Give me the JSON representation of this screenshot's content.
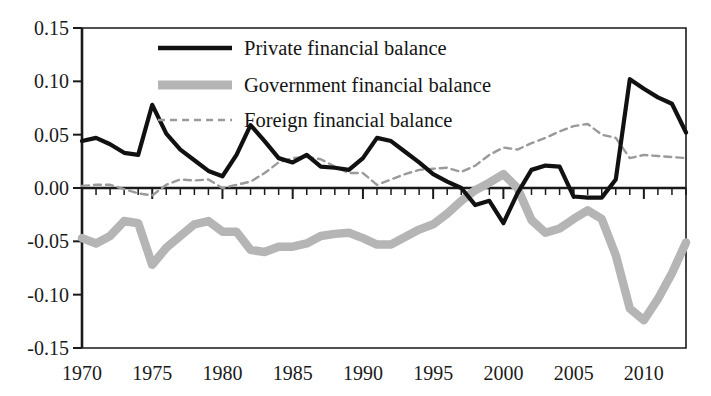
{
  "chart_data": {
    "type": "line",
    "title": "",
    "subtitle": "",
    "xlabel": "",
    "ylabel": "",
    "xlim": [
      1970,
      2013
    ],
    "ylim": [
      -0.15,
      0.15
    ],
    "grid": false,
    "legend_position": "top-center",
    "x_tick_labels": [
      "1970",
      "1975",
      "1980",
      "1985",
      "1990",
      "1995",
      "2000",
      "2005",
      "2010"
    ],
    "x_tick_values": [
      1970,
      1975,
      1980,
      1985,
      1990,
      1995,
      2000,
      2005,
      2010
    ],
    "x_minor_tick_step": 1,
    "y_tick_labels": [
      "0.15",
      "0.10",
      "0.05",
      "0.00",
      "-0.05",
      "-0.10",
      "-0.15"
    ],
    "y_tick_values": [
      0.15,
      0.1,
      0.05,
      0,
      -0.05,
      -0.1,
      -0.15
    ],
    "x": [
      1970,
      1971,
      1972,
      1973,
      1974,
      1975,
      1976,
      1977,
      1978,
      1979,
      1980,
      1981,
      1982,
      1983,
      1984,
      1985,
      1986,
      1987,
      1988,
      1989,
      1990,
      1991,
      1992,
      1993,
      1994,
      1995,
      1996,
      1997,
      1998,
      1999,
      2000,
      2001,
      2002,
      2003,
      2004,
      2005,
      2006,
      2007,
      2008,
      2009,
      2010,
      2011,
      2012,
      2013
    ],
    "series": [
      {
        "name": "Private financial balance",
        "color": "#111111",
        "style": "solid",
        "width": 4.2,
        "values": [
          0.044,
          0.047,
          0.041,
          0.033,
          0.031,
          0.078,
          0.051,
          0.036,
          0.026,
          0.016,
          0.011,
          0.031,
          0.059,
          0.044,
          0.028,
          0.024,
          0.031,
          0.02,
          0.019,
          0.017,
          0.028,
          0.047,
          0.044,
          0.034,
          0.024,
          0.013,
          0.006,
          0.0,
          -0.016,
          -0.012,
          -0.033,
          -0.005,
          0.017,
          0.021,
          0.02,
          -0.008,
          -0.009,
          -0.009,
          0.008,
          0.102,
          0.093,
          0.085,
          0.079,
          0.052
        ]
      },
      {
        "name": "Government financial balance",
        "color": "#b5b5b5",
        "style": "solid",
        "width": 8.5,
        "values": [
          -0.047,
          -0.052,
          -0.045,
          -0.031,
          -0.033,
          -0.072,
          -0.056,
          -0.045,
          -0.034,
          -0.031,
          -0.041,
          -0.041,
          -0.058,
          -0.06,
          -0.055,
          -0.055,
          -0.052,
          -0.045,
          -0.043,
          -0.042,
          -0.047,
          -0.053,
          -0.053,
          -0.046,
          -0.039,
          -0.034,
          -0.024,
          -0.012,
          -0.002,
          0.005,
          0.013,
          0.0,
          -0.03,
          -0.042,
          -0.038,
          -0.029,
          -0.021,
          -0.029,
          -0.063,
          -0.113,
          -0.124,
          -0.104,
          -0.08,
          -0.051
        ]
      },
      {
        "name": "Foreign financial balance",
        "color": "#9a9a9a",
        "style": "dashed",
        "width": 2.4,
        "values": [
          0.002,
          0.003,
          0.003,
          -0.001,
          -0.005,
          -0.007,
          0.003,
          0.008,
          0.007,
          0.008,
          0.0,
          0.003,
          0.006,
          0.014,
          0.024,
          0.028,
          0.029,
          0.027,
          0.02,
          0.014,
          0.014,
          0.003,
          0.008,
          0.013,
          0.017,
          0.018,
          0.019,
          0.015,
          0.021,
          0.031,
          0.038,
          0.036,
          0.042,
          0.047,
          0.053,
          0.058,
          0.06,
          0.05,
          0.047,
          0.028,
          0.031,
          0.03,
          0.029,
          0.028
        ]
      }
    ]
  },
  "legend": {
    "items": [
      {
        "label": "Private financial balance",
        "swatch": "solid-black-line"
      },
      {
        "label": "Government financial balance",
        "swatch": "thick-gray-line"
      },
      {
        "label": "Foreign financial balance",
        "swatch": "dashed-gray-line"
      }
    ]
  },
  "style": {
    "axis_color": "#1a1a1a",
    "background": "#ffffff",
    "private_color": "#111111",
    "government_color": "#b5b5b5",
    "foreign_color": "#9a9a9a"
  }
}
